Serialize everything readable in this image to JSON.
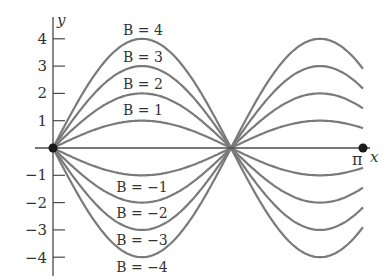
{
  "chart_data": {
    "type": "line",
    "title": "",
    "xlabel": "x",
    "ylabel": "y",
    "function": "y = B sin(kx), k ≈ 1.74",
    "xlim": [
      0,
      3.1416
    ],
    "ylim": [
      -4.5,
      4.5
    ],
    "grid": false,
    "legend": "inline labels",
    "yticks": [
      4,
      3,
      2,
      1,
      -1,
      -2,
      -3,
      -4
    ],
    "ytick_labels": [
      "4",
      "3",
      "2",
      "1",
      "−1",
      "−2",
      "−3",
      "−4"
    ],
    "x_marks": [
      {
        "label": "π",
        "value": 3.1416
      }
    ],
    "points": [
      {
        "x": 0,
        "y": 0
      },
      {
        "x": 3.1416,
        "y": 0
      }
    ],
    "series": [
      {
        "name": "B = 4",
        "B": 4
      },
      {
        "name": "B = 3",
        "B": 3
      },
      {
        "name": "B = 2",
        "B": 2
      },
      {
        "name": "B = 1",
        "B": 1
      },
      {
        "name": "B = −1",
        "B": -1
      },
      {
        "name": "B = −2",
        "B": -2
      },
      {
        "name": "B = −3",
        "B": -3
      },
      {
        "name": "B = −4",
        "B": -4
      }
    ]
  },
  "labels": {
    "y_axis": "y",
    "x_axis": "x",
    "pi": "π",
    "b4": "B = 4",
    "b3": "B = 3",
    "b2": "B = 2",
    "b1": "B = 1",
    "bm1": "B = −1",
    "bm2": "B = −2",
    "bm3": "B = −3",
    "bm4": "B = −4",
    "t4": "4",
    "t3": "3",
    "t2": "2",
    "t1": "1",
    "tm1": "−1",
    "tm2": "−2",
    "tm3": "−3",
    "tm4": "−4"
  },
  "colors": {
    "curve": "#7a7a7a",
    "axis": "#4a4a4a",
    "text": "#333333",
    "dot": "#1a1a1a"
  }
}
